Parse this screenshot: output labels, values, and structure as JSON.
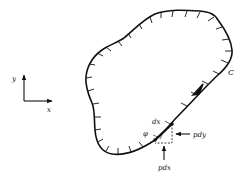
{
  "diagram": {
    "type": "boundary-contour",
    "contour": {
      "label": "C",
      "stroke_color": "#111111",
      "direction_arrow": "counter-clockwise tangent arrow near right side"
    },
    "axes": {
      "x_label": "x",
      "y_label": "y"
    },
    "element": {
      "length_label": "dx",
      "angle_label": "φ",
      "force_horizontal_label": "pdy",
      "force_vertical_label": "pdx"
    }
  }
}
